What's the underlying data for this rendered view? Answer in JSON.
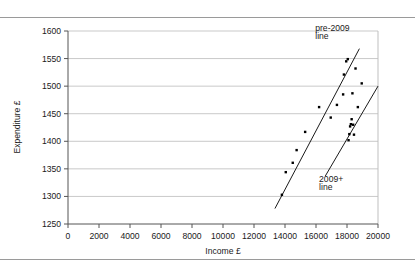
{
  "figure": {
    "name": "income-expenditure-scatter"
  },
  "chart_data": {
    "type": "scatter",
    "title": "",
    "xlabel": "Income £",
    "ylabel": "Expenditure £",
    "xlim": [
      0,
      20000
    ],
    "ylim": [
      1250,
      1600
    ],
    "xticks": [
      0,
      2000,
      4000,
      6000,
      8000,
      10000,
      12000,
      14000,
      16000,
      18000,
      20000
    ],
    "yticks": [
      1250,
      1300,
      1350,
      1400,
      1450,
      1500,
      1550,
      1600
    ],
    "xtick_labels": [
      "0",
      "2000",
      "4000",
      "6000",
      "8000",
      "10000",
      "12000",
      "14000",
      "16000",
      "18000",
      "20000"
    ],
    "ytick_labels": [
      "1250",
      "1300",
      "1350",
      "1400",
      "1450",
      "1500",
      "1550",
      "1600"
    ],
    "grid": "horizontal",
    "legend": "none",
    "marker": "square",
    "marker_color": "#000000",
    "points": [
      [
        13800,
        1303
      ],
      [
        14050,
        1344
      ],
      [
        14500,
        1361
      ],
      [
        14750,
        1384
      ],
      [
        15300,
        1417
      ],
      [
        16200,
        1462
      ],
      [
        16950,
        1443
      ],
      [
        17350,
        1466
      ],
      [
        17750,
        1485
      ],
      [
        17800,
        1521
      ],
      [
        17950,
        1545
      ],
      [
        18050,
        1549
      ],
      [
        18100,
        1402
      ],
      [
        18150,
        1413
      ],
      [
        18200,
        1427
      ],
      [
        18250,
        1431
      ],
      [
        18300,
        1440
      ],
      [
        18350,
        1487
      ],
      [
        18400,
        1430
      ],
      [
        18450,
        1412
      ],
      [
        18550,
        1532
      ],
      [
        18700,
        1462
      ],
      [
        18950,
        1505
      ]
    ],
    "lines": [
      {
        "name": "pre-2009 line",
        "x": [
          13350,
          18800
        ],
        "y": [
          1278,
          1568
        ],
        "label": "pre-2009",
        "label2": "line",
        "color": "#000000"
      },
      {
        "name": "2009+ line",
        "x": [
          16600,
          20000
        ],
        "y": [
          1337,
          1500
        ],
        "label": "2009+",
        "label2": "line",
        "color": "#000000"
      }
    ],
    "annotations": [
      {
        "text": "pre-2009",
        "x": 15950,
        "y": 1600
      },
      {
        "text": "line",
        "x": 15950,
        "y": 1585
      },
      {
        "text": "2009+",
        "x": 16200,
        "y": 1327
      },
      {
        "text": "line",
        "x": 16200,
        "y": 1312
      }
    ]
  }
}
